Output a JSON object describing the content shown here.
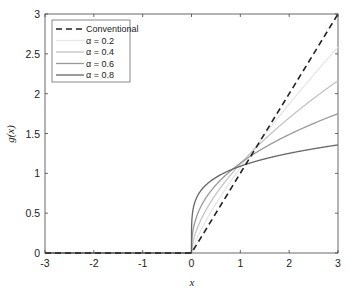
{
  "chart_data": {
    "type": "line",
    "title": "",
    "xlabel": "x",
    "ylabel": "g(x)",
    "xlim": [
      -3,
      3
    ],
    "ylim": [
      0,
      3
    ],
    "xticks": [
      -3,
      -2,
      -1,
      0,
      1,
      2,
      3
    ],
    "yticks": [
      0,
      0.5,
      1,
      1.5,
      2,
      2.5,
      3
    ],
    "grid": false,
    "legend_position": "upper left",
    "series": [
      {
        "name": "Conventional",
        "alpha": 1.0,
        "color": "#222222",
        "dash": true,
        "x": [
          -3,
          0,
          1,
          2,
          3
        ],
        "y": [
          0,
          0,
          1,
          2,
          3
        ]
      },
      {
        "name": "α = 0.2",
        "alpha": 0.2,
        "color": "#e6e6e6",
        "dash": false,
        "x": [
          -3,
          0,
          0.5,
          1,
          1.5,
          2,
          2.5,
          3
        ],
        "y": [
          0,
          0,
          0.62,
          1.07,
          1.48,
          1.87,
          2.24,
          2.59
        ]
      },
      {
        "name": "α = 0.4",
        "alpha": 0.4,
        "color": "#c4c4c4",
        "dash": false,
        "x": [
          -3,
          0,
          0.5,
          1,
          1.5,
          2,
          2.5,
          3
        ],
        "y": [
          0,
          0,
          0.74,
          1.12,
          1.43,
          1.69,
          1.94,
          2.16
        ]
      },
      {
        "name": "α = 0.6",
        "alpha": 0.6,
        "color": "#999999",
        "dash": false,
        "x": [
          -3,
          0,
          0.5,
          1,
          1.5,
          2,
          2.5,
          3
        ],
        "y": [
          0,
          0,
          0.85,
          1.13,
          1.33,
          1.49,
          1.62,
          1.75
        ]
      },
      {
        "name": "α = 0.8",
        "alpha": 0.8,
        "color": "#666666",
        "dash": false,
        "x": [
          -3,
          0,
          0.5,
          1,
          1.5,
          2,
          2.5,
          3
        ],
        "y": [
          0,
          0,
          0.95,
          1.09,
          1.18,
          1.25,
          1.31,
          1.36
        ]
      }
    ]
  },
  "legend": {
    "items": [
      "Conventional",
      "α = 0.2",
      "α = 0.4",
      "α = 0.6",
      "α = 0.8"
    ]
  }
}
